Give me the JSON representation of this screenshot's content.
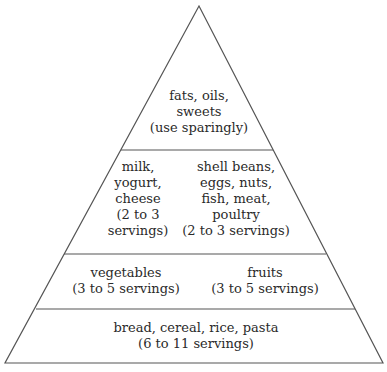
{
  "diagram": {
    "type": "food-pyramid",
    "line_color": "#555555",
    "tiers": [
      {
        "level": 1,
        "position": "top",
        "groups": [
          {
            "lines": [
              "fats, oils,",
              "sweets",
              "(use sparingly)"
            ]
          }
        ]
      },
      {
        "level": 2,
        "position": "second",
        "groups": [
          {
            "lines": [
              "milk,",
              "yogurt,",
              "cheese",
              "(2 to 3",
              "servings)"
            ]
          },
          {
            "lines": [
              "shell beans,",
              "eggs, nuts,",
              "fish, meat,",
              "poultry",
              "(2 to 3 servings)"
            ]
          }
        ]
      },
      {
        "level": 3,
        "position": "third",
        "groups": [
          {
            "lines": [
              "vegetables",
              "(3 to 5 servings)"
            ]
          },
          {
            "lines": [
              "fruits",
              "(3 to 5 servings)"
            ]
          }
        ]
      },
      {
        "level": 4,
        "position": "base",
        "groups": [
          {
            "lines": [
              "bread, cereal, rice, pasta",
              "(6 to 11 servings)"
            ]
          }
        ]
      }
    ]
  }
}
